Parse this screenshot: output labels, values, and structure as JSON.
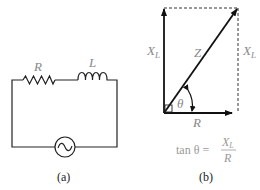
{
  "figure_a": {
    "caption": "(a)",
    "labels": {
      "resistor": "R",
      "inductor": "L"
    },
    "components": [
      "resistor",
      "inductor",
      "ac-source"
    ]
  },
  "figure_b": {
    "caption": "(b)",
    "labels": {
      "xl_left": "X",
      "xl_left_sub": "L",
      "xl_right": "X",
      "xl_right_sub": "L",
      "z": "Z",
      "theta": "θ",
      "r": "R"
    },
    "equation": {
      "lhs": "tan θ =",
      "numerator": "X",
      "numerator_sub": "L",
      "denominator": "R"
    }
  }
}
